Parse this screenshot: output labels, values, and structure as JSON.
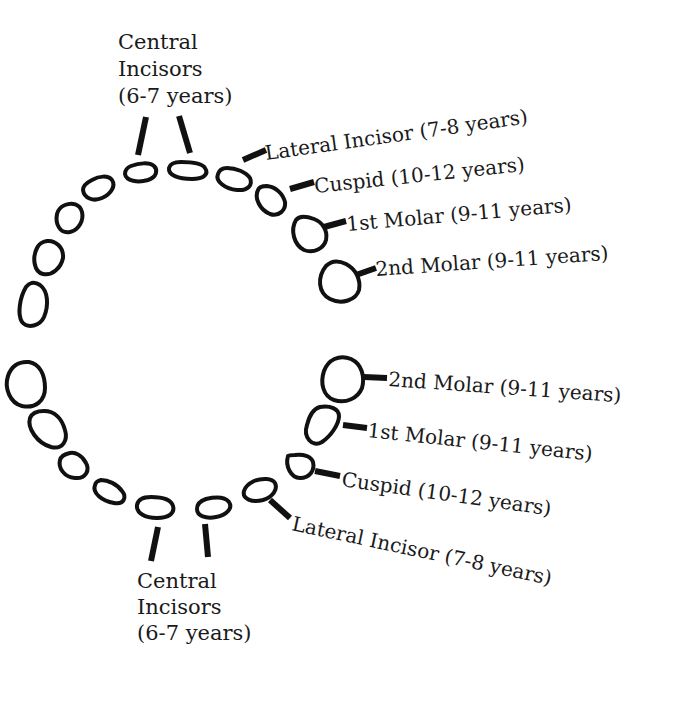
{
  "diagram": {
    "type": "dental-arch-eruption-chart",
    "upper_arch": {
      "central_incisors": {
        "line1": "Central",
        "line2": "Incisors",
        "line3": "(6-7 years)"
      },
      "labels": [
        {
          "id": "lateral-incisor",
          "text": "Lateral Incisor (7-8 years)"
        },
        {
          "id": "cuspid",
          "text": "Cuspid (10-12 years)"
        },
        {
          "id": "first-molar",
          "text": "1st Molar (9-11 years)"
        },
        {
          "id": "second-molar",
          "text": "2nd Molar (9-11 years)"
        }
      ]
    },
    "lower_arch": {
      "central_incisors": {
        "line1": "Central",
        "line2": "Incisors",
        "line3": "(6-7 years)"
      },
      "labels": [
        {
          "id": "second-molar",
          "text": "2nd Molar (9-11 years)"
        },
        {
          "id": "first-molar",
          "text": "1st Molar (9-11 years)"
        },
        {
          "id": "cuspid",
          "text": "Cuspid (10-12 years)"
        },
        {
          "id": "lateral-incisor",
          "text": "Lateral Incisor (7-8 years)"
        }
      ]
    },
    "colors": {
      "ink": "#111111",
      "background": "#ffffff"
    }
  }
}
